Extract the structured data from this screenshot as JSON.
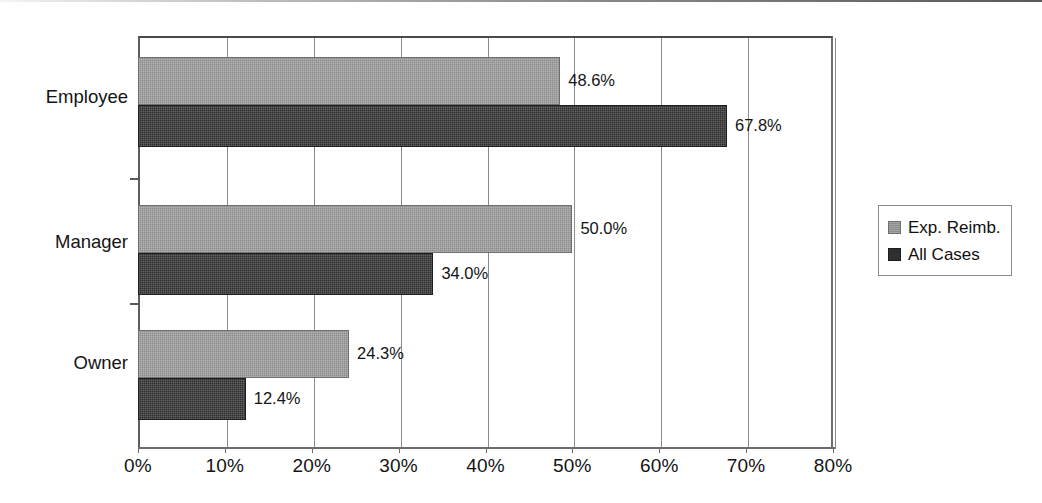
{
  "chart_data": {
    "type": "bar",
    "orientation": "horizontal",
    "grouped": true,
    "title": "",
    "subtitle": "",
    "xlabel": "",
    "ylabel": "",
    "categories": [
      "Employee",
      "Manager",
      "Owner"
    ],
    "series": [
      {
        "name": "Exp. Reimb.",
        "color": "#8d8d8d",
        "values": [
          48.6,
          50.0,
          24.3
        ],
        "labels": [
          "48.6%",
          "50.0%",
          "24.3%"
        ]
      },
      {
        "name": "All Cases",
        "color": "#2f2f2f",
        "values": [
          67.8,
          34.0,
          12.4
        ],
        "labels": [
          "67.8%",
          "34.0%",
          "12.4%"
        ]
      }
    ],
    "xlim": [
      0,
      80
    ],
    "xticks": [
      0,
      10,
      20,
      30,
      40,
      50,
      60,
      70,
      80
    ],
    "xticklabels": [
      "0%",
      "10%",
      "20%",
      "30%",
      "40%",
      "50%",
      "60%",
      "70%",
      "80%"
    ],
    "grid": true,
    "grid_axis": "x",
    "legend_position": "right-outside",
    "value_labels": true,
    "value_label_format": "0.0%"
  },
  "axis": {
    "x_ticks": [
      {
        "value": 0,
        "label": "0%"
      },
      {
        "value": 10,
        "label": "10%"
      },
      {
        "value": 20,
        "label": "20%"
      },
      {
        "value": 30,
        "label": "30%"
      },
      {
        "value": 40,
        "label": "40%"
      },
      {
        "value": 50,
        "label": "50%"
      },
      {
        "value": 60,
        "label": "60%"
      },
      {
        "value": 70,
        "label": "70%"
      },
      {
        "value": 80,
        "label": "80%"
      }
    ],
    "categories": [
      {
        "label": "Employee"
      },
      {
        "label": "Manager"
      },
      {
        "label": "Owner"
      }
    ]
  },
  "bars": [
    {
      "category": "Employee",
      "series": "Exp. Reimb.",
      "value": 48.6,
      "label": "48.6%"
    },
    {
      "category": "Employee",
      "series": "All Cases",
      "value": 67.8,
      "label": "67.8%"
    },
    {
      "category": "Manager",
      "series": "Exp. Reimb.",
      "value": 50.0,
      "label": "50.0%"
    },
    {
      "category": "Manager",
      "series": "All Cases",
      "value": 34.0,
      "label": "34.0%"
    },
    {
      "category": "Owner",
      "series": "Exp. Reimb.",
      "value": 24.3,
      "label": "24.3%"
    },
    {
      "category": "Owner",
      "series": "All Cases",
      "value": 12.4,
      "label": "12.4%"
    }
  ],
  "legend": {
    "items": [
      {
        "label": "Exp. Reimb.",
        "color": "#8d8d8d"
      },
      {
        "label": "All Cases",
        "color": "#2f2f2f"
      }
    ]
  }
}
